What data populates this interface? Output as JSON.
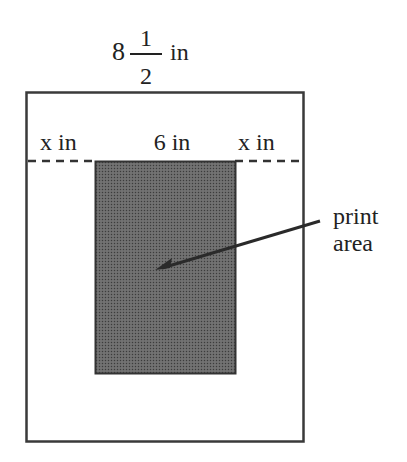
{
  "diagram": {
    "page_width_label": {
      "whole": "8",
      "numerator": "1",
      "denominator": "2",
      "unit": "in"
    },
    "left_margin_label": "x in",
    "print_width_label": "6 in",
    "right_margin_label": "x in",
    "callout_label_line1": "print",
    "callout_label_line2": "area",
    "colors": {
      "outline": "#3a3a3a",
      "print_area": "#5a5a5a",
      "background": "#ffffff"
    }
  }
}
